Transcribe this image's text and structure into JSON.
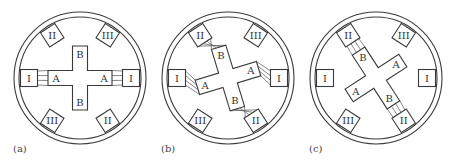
{
  "figure": {
    "panels": [
      {
        "id": "a",
        "caption": "(a)",
        "center": [
          80,
          78
        ],
        "rotor_rotation_deg": 0,
        "stator_poles": [
          {
            "label": "I",
            "shape": "square",
            "angle": 180
          },
          {
            "label": "I",
            "shape": "square",
            "angle": 0
          },
          {
            "label": "II",
            "shape": "diamond",
            "angle": -123
          },
          {
            "label": "III",
            "shape": "diamond",
            "angle": -57
          },
          {
            "label": "III",
            "shape": "diamond",
            "angle": 123
          },
          {
            "label": "II",
            "shape": "diamond",
            "angle": 57
          }
        ],
        "rotor_labels": {
          "a": "A",
          "b": "B"
        },
        "flux_links": [
          "I-A"
        ]
      },
      {
        "id": "b",
        "caption": "(b)",
        "center": [
          228,
          78
        ],
        "rotor_rotation_deg": -17,
        "stator_poles": [
          {
            "label": "I",
            "shape": "square",
            "angle": 180
          },
          {
            "label": "I",
            "shape": "square",
            "angle": 0
          },
          {
            "label": "II",
            "shape": "diamond",
            "angle": -123
          },
          {
            "label": "III",
            "shape": "diamond",
            "angle": -57
          },
          {
            "label": "III",
            "shape": "diamond",
            "angle": 123
          },
          {
            "label": "II",
            "shape": "diamond",
            "angle": 57
          }
        ],
        "rotor_labels": {
          "a": "A",
          "b": "B"
        },
        "flux_links": [
          "I-A",
          "II-B"
        ]
      },
      {
        "id": "c",
        "caption": "(c)",
        "center": [
          376,
          78
        ],
        "rotor_rotation_deg": -33,
        "stator_poles": [
          {
            "label": "I",
            "shape": "square",
            "angle": 180
          },
          {
            "label": "I",
            "shape": "square",
            "angle": 0
          },
          {
            "label": "II",
            "shape": "diamond",
            "angle": -123
          },
          {
            "label": "III",
            "shape": "diamond",
            "angle": -57
          },
          {
            "label": "III",
            "shape": "diamond",
            "angle": 123
          },
          {
            "label": "II",
            "shape": "diamond",
            "angle": 57
          }
        ],
        "rotor_labels": {
          "a": "A",
          "b": "B"
        },
        "flux_links": [
          "II-B"
        ]
      }
    ]
  },
  "style": {
    "line_color": "#3a3a3a",
    "background": "#ffffff"
  }
}
